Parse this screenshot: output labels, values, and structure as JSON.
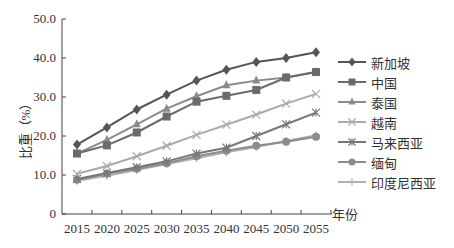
{
  "chart_data": {
    "type": "line",
    "title": "",
    "xlabel": "年份",
    "ylabel": "比重（%）",
    "x": [
      2015,
      2020,
      2025,
      2030,
      2035,
      2040,
      2045,
      2050,
      2055
    ],
    "ylim": [
      0,
      50
    ],
    "yticks": [
      "0",
      "10.0",
      "20.0",
      "30.0",
      "40.0",
      "50.0"
    ],
    "grid": false,
    "legend_position": "right",
    "series": [
      {
        "name": "新加坡",
        "marker": "diamond",
        "color": "#555555",
        "values": [
          17.8,
          22.2,
          26.8,
          30.6,
          34.2,
          37.0,
          39.0,
          40.0,
          41.5
        ]
      },
      {
        "name": "中国",
        "marker": "square",
        "color": "#6b6b6b",
        "values": [
          15.5,
          17.6,
          20.9,
          25.0,
          28.8,
          30.3,
          31.8,
          35.0,
          36.4
        ]
      },
      {
        "name": "泰国",
        "marker": "triangle",
        "color": "#8a8a8a",
        "values": [
          15.5,
          19.0,
          23.0,
          27.0,
          30.2,
          33.0,
          34.2,
          35.0,
          36.4
        ]
      },
      {
        "name": "越南",
        "marker": "x",
        "color": "#aaaaaa",
        "values": [
          10.3,
          12.3,
          14.8,
          17.5,
          20.3,
          22.9,
          25.5,
          28.3,
          30.8
        ]
      },
      {
        "name": "马来西亚",
        "marker": "star",
        "color": "#777777",
        "values": [
          9.0,
          10.5,
          12.0,
          13.5,
          15.5,
          17.0,
          20.0,
          23.0,
          26.0
        ]
      },
      {
        "name": "缅甸",
        "marker": "circle",
        "color": "#8c8c8c",
        "values": [
          8.8,
          10.3,
          11.6,
          13.0,
          14.8,
          16.2,
          17.5,
          18.5,
          19.8
        ]
      },
      {
        "name": "印度尼西亚",
        "marker": "plus",
        "color": "#b0b0b0",
        "values": [
          8.5,
          9.8,
          11.3,
          12.8,
          14.3,
          15.8,
          17.2,
          18.7,
          20.2
        ]
      }
    ]
  },
  "axis": {
    "y_label": "比重（%）",
    "x_unit": "年份"
  }
}
